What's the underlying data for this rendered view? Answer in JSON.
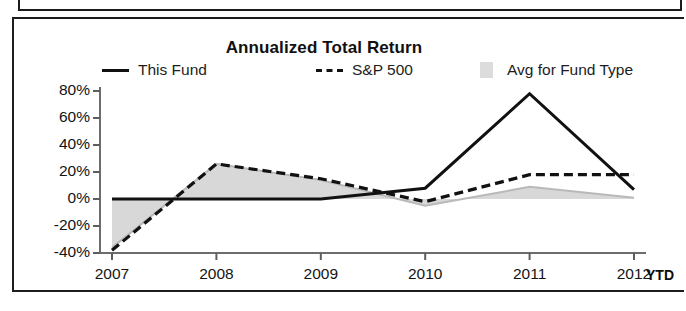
{
  "chart_data": {
    "type": "line",
    "title": "Annualized Total Return",
    "xlabel": "",
    "ylabel": "",
    "categories": [
      "2007",
      "2008",
      "2009",
      "2010",
      "2011",
      "2012"
    ],
    "x_last_note": "YTD",
    "ytick_labels": [
      "80%",
      "60%",
      "40%",
      "20%",
      "0%",
      "-20%",
      "-40%"
    ],
    "ytick_values": [
      80,
      60,
      40,
      20,
      0,
      -20,
      -40
    ],
    "ylim": [
      -40,
      80
    ],
    "grid": false,
    "legend_position": "top",
    "series": [
      {
        "name": "This Fund",
        "style": "solid-black",
        "color": "#111111",
        "values": [
          0,
          0,
          0,
          8,
          78,
          7
        ]
      },
      {
        "name": "S&P 500",
        "style": "dashed-black",
        "color": "#111111",
        "values": [
          -38,
          26,
          15,
          -2,
          18,
          18
        ]
      },
      {
        "name": "Avg for Fund Type",
        "style": "filled-gray-area",
        "color": "#d6d6d6",
        "values": [
          -36,
          26,
          14,
          -5,
          9,
          1
        ]
      }
    ]
  },
  "chart": {
    "title": "Annualized Total Return",
    "legend": [
      {
        "label": "This Fund",
        "icon": "solid-line-swatch"
      },
      {
        "label": "S&P 500",
        "icon": "dashed-line-swatch"
      },
      {
        "label": "Avg for Fund Type",
        "icon": "gray-box-swatch"
      }
    ],
    "ytd_label": "YTD"
  }
}
